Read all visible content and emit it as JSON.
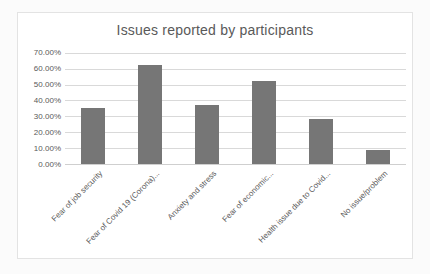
{
  "chart_data": {
    "type": "bar",
    "title": "Issues reported by participants",
    "categories": [
      "Fear of job security",
      "Fear of Covid 19 (Corona)...",
      "Anxiety and stress",
      "Fear of economic...",
      "Health issue due to Covid...",
      "No issue/problem"
    ],
    "values": [
      35,
      62,
      37,
      52,
      28,
      9
    ],
    "value_unit": "percent",
    "xlabel": "",
    "ylabel": "",
    "ylim": [
      0,
      70
    ],
    "ytick_step": 10,
    "ytick_labels": [
      "0.00%",
      "10.00%",
      "20.00%",
      "30.00%",
      "40.00%",
      "50.00%",
      "60.00%",
      "70.00%"
    ],
    "grid": true,
    "legend": "none",
    "bar_color": "#767676",
    "gridline_color": "#d9d9d9",
    "axis_line_color": "#cfcfcf",
    "axis_text_color": "#595959",
    "title_color": "#595959",
    "plot_background": "#ffffff",
    "chart_border_color": "#e3e3e3"
  }
}
